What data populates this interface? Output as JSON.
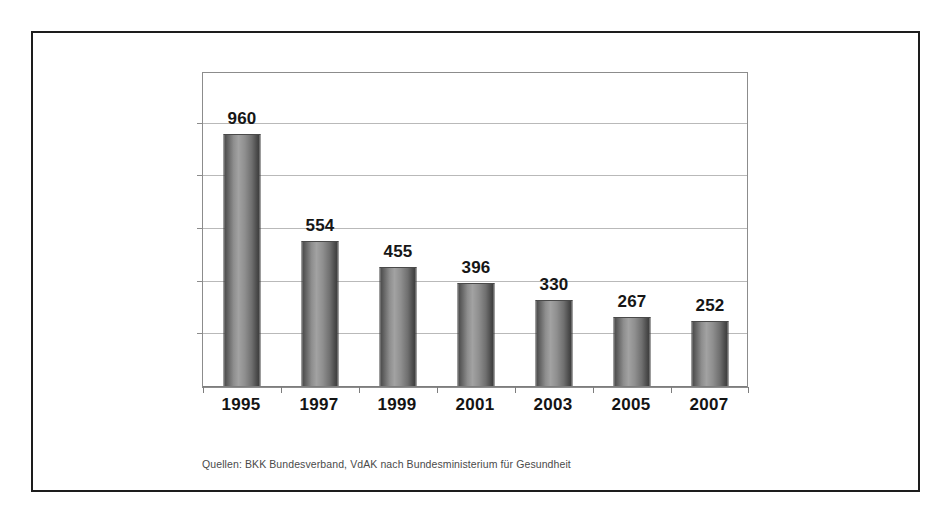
{
  "figure": {
    "background_color": "#ffffff",
    "border_color": "#1d1d1d",
    "caption": "Quellen: BKK Bundesverband, VdAK nach Bundesministerium für Gesundheit"
  },
  "chart_data": {
    "type": "bar",
    "title": "",
    "subtitle": "",
    "xlabel": "",
    "ylabel": "",
    "categories": [
      "1995",
      "1997",
      "1999",
      "2001",
      "2003",
      "2005",
      "2007"
    ],
    "values": [
      960,
      554,
      455,
      396,
      330,
      267,
      252
    ],
    "data_labels": [
      "960",
      "554",
      "455",
      "396",
      "330",
      "267",
      "252"
    ],
    "series": [
      {
        "name": "Anzahl",
        "values": [
          960,
          554,
          455,
          396,
          330,
          267,
          252
        ]
      }
    ],
    "ylim": [
      0,
      1200
    ],
    "y_gridline_values": [
      200,
      400,
      600,
      800,
      1000
    ],
    "y_tick_labels": [],
    "grid": true,
    "legend": false,
    "legend_position": "none",
    "bar_color": "#8e8e8e",
    "bar_edge_color": "#3a3a3a",
    "bar_style": "cylinder",
    "axis_color": "#8c8c8c",
    "gridline_color": "#b9b9b9",
    "label_color": "#161616",
    "annotations": []
  }
}
